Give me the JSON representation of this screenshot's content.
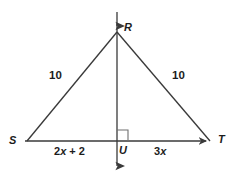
{
  "figure": {
    "kind": "geometry-diagram",
    "shape": "isosceles-triangle-with-perpendicular-bisector",
    "background_color": "#ffffff",
    "stroke_color": "#3a3a3a",
    "text_color": "#1c1c1c"
  },
  "vertices": {
    "apex": {
      "name": "R",
      "x": 117,
      "y": 32
    },
    "left_base": {
      "name": "S",
      "x": 27,
      "y": 141
    },
    "right_base": {
      "name": "T",
      "x": 210,
      "y": 141
    },
    "foot": {
      "name": "U",
      "x": 117,
      "y": 141
    }
  },
  "labels": {
    "R": "R",
    "S": "S",
    "T": "T",
    "U": "U",
    "left_leg_length": "10",
    "right_leg_length": "10",
    "left_base_segment": "2x + 2",
    "right_base_segment": "3x"
  },
  "segment_expressions": {
    "left_base_coefficient": "2",
    "left_base_variable": "x",
    "left_base_constant": "2",
    "right_base_coefficient": "3",
    "right_base_variable": "x"
  },
  "markers": {
    "right_angle_at": "U",
    "right_angle_symbol": "right-angle-square",
    "vertical_line_arrow_top": "up-arrow",
    "vertical_line_arrow_bottom": "down-arrow",
    "base_line_arrow_right": "right-arrow"
  },
  "chart_data": {
    "type": "table",
    "categories": [
      "RS",
      "RT",
      "SU",
      "UT"
    ],
    "values": [
      "10",
      "10",
      "2x + 2",
      "3x"
    ],
    "xlabel": "segment",
    "ylabel": "length"
  }
}
